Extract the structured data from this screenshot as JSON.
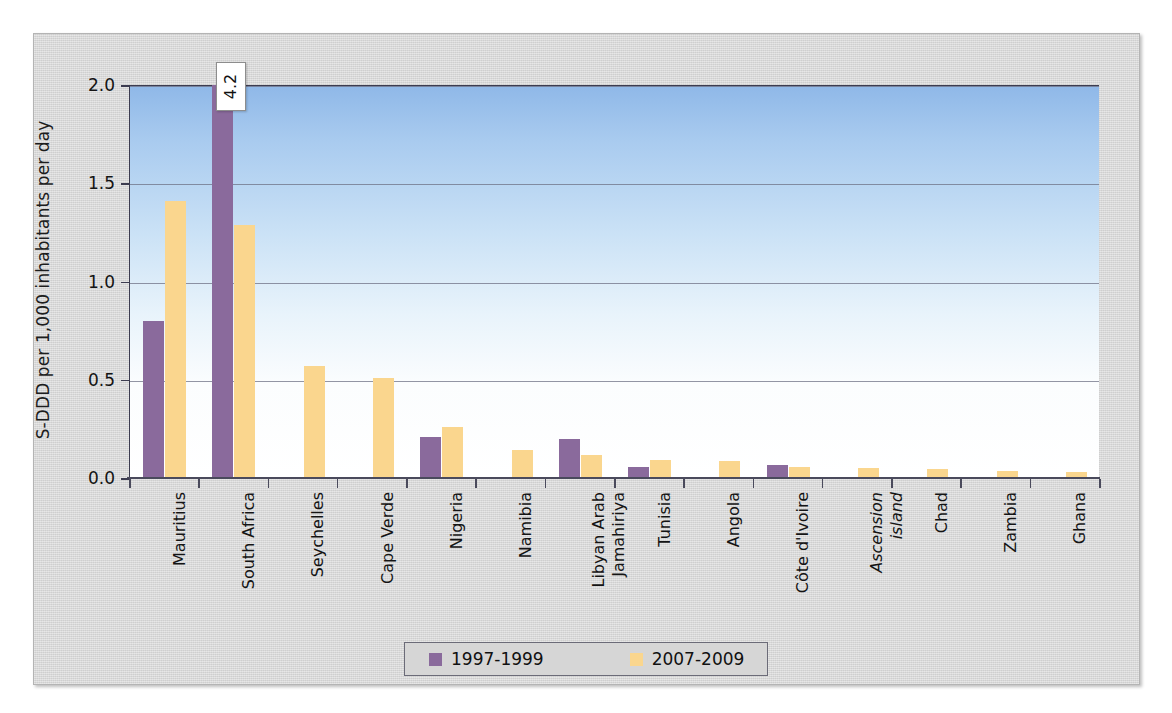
{
  "chart_data": {
    "type": "bar",
    "title": "",
    "xlabel": "",
    "ylabel": "S-DDD per 1,000 inhabitants per day",
    "ylim": [
      0,
      2.0
    ],
    "ytick_labels": [
      "0.0",
      "0.5",
      "1.0",
      "1.5",
      "2.0"
    ],
    "ytick_values": [
      0.0,
      0.5,
      1.0,
      1.5,
      2.0
    ],
    "grid": true,
    "legend_position": "bottom",
    "categories": [
      "Mauritius",
      "South Africa",
      "Seychelles",
      "Cape Verde",
      "Nigeria",
      "Namibia",
      "Libyan Arab\nJamahiriya",
      "Tunisia",
      "Angola",
      "Côte d'Ivoire",
      "Ascension\nisland",
      "Chad",
      "Zambia",
      "Ghana"
    ],
    "category_styles": [
      "normal",
      "normal",
      "normal",
      "normal",
      "normal",
      "normal",
      "normal",
      "normal",
      "normal",
      "normal",
      "italic",
      "normal",
      "normal",
      "normal"
    ],
    "series": [
      {
        "name": "1997-1999",
        "color": "#8a6a9c",
        "values": [
          0.8,
          4.2,
          0,
          0,
          0.21,
          0,
          0.2,
          0.055,
          0,
          0.065,
          0,
          0,
          0,
          0
        ]
      },
      {
        "name": "2007-2009",
        "color": "#fad68e",
        "values": [
          1.41,
          1.29,
          0.57,
          0.51,
          0.26,
          0.145,
          0.115,
          0.09,
          0.085,
          0.055,
          0.05,
          0.045,
          0.035,
          0.03
        ]
      }
    ],
    "annotations": [
      {
        "category": "South Africa",
        "series": "1997-1999",
        "text": "4.2",
        "note": "value exceeds axis maximum; shown as callout label"
      }
    ]
  }
}
